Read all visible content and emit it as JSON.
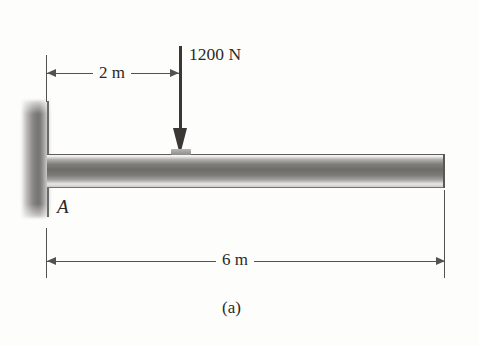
{
  "figure": {
    "caption": "(a)",
    "support_label": "A",
    "background_color": "#fdfdfc",
    "ink_color": "#2b2926"
  },
  "load": {
    "magnitude_label": "1200 N",
    "value": 1200,
    "unit": "N",
    "direction": "down",
    "position_from_A_label": "2 m",
    "position_from_A_value": 2
  },
  "dimensions": [
    {
      "label": "2 m",
      "value": 2,
      "unit": "m",
      "from": "A",
      "to": "load point",
      "placement": "above-beam"
    },
    {
      "label": "6 m",
      "value": 6,
      "unit": "m",
      "from": "A",
      "to": "free end",
      "placement": "below-beam"
    }
  ],
  "beam": {
    "type": "cantilever",
    "fixed_end_label": "A",
    "total_length_label": "6 m",
    "free_end": "right"
  },
  "icons": {
    "wall_hatch": "fixed-support-hatching",
    "load_arrow": "down-arrow-icon",
    "dim_arrow_left": "arrow-left-icon",
    "dim_arrow_right": "arrow-right-icon"
  }
}
